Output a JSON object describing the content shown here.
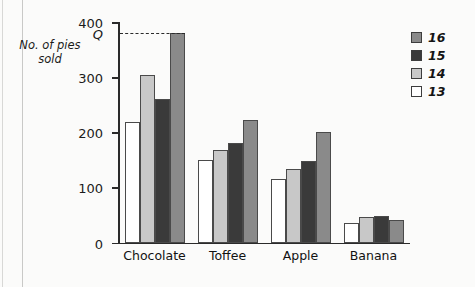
{
  "chart_data": {
    "type": "bar",
    "title": "",
    "xlabel": "",
    "ylabel": "No. of pies sold",
    "ylim": [
      0,
      400
    ],
    "yticks": [
      0,
      100,
      200,
      300,
      400
    ],
    "ytick_labels": [
      "0",
      "100",
      "200",
      "300",
      "400"
    ],
    "grid": false,
    "legend_position": "right",
    "categories": [
      "Chocolate",
      "Toffee",
      "Apple",
      "Banana"
    ],
    "series": [
      {
        "name": "13",
        "color": "#ffffff",
        "values": [
          218,
          150,
          115,
          36
        ]
      },
      {
        "name": "14",
        "color": "#c8c8c8",
        "values": [
          303,
          167,
          133,
          46
        ]
      },
      {
        "name": "15",
        "color": "#3a3a3a",
        "values": [
          260,
          180,
          147,
          48
        ]
      },
      {
        "name": "16",
        "color": "#8a8a8a",
        "values": [
          380,
          222,
          200,
          40
        ]
      }
    ],
    "annotations": [
      {
        "name": "q-reference-line",
        "label": "Q",
        "value": 380,
        "style": "dashed",
        "from": "y-axis",
        "to": "Chocolate-16-bar"
      }
    ]
  },
  "legend": {
    "entries": [
      "16",
      "15",
      "14",
      "13"
    ],
    "colors": [
      "#8a8a8a",
      "#3a3a3a",
      "#c8c8c8",
      "#ffffff"
    ]
  }
}
